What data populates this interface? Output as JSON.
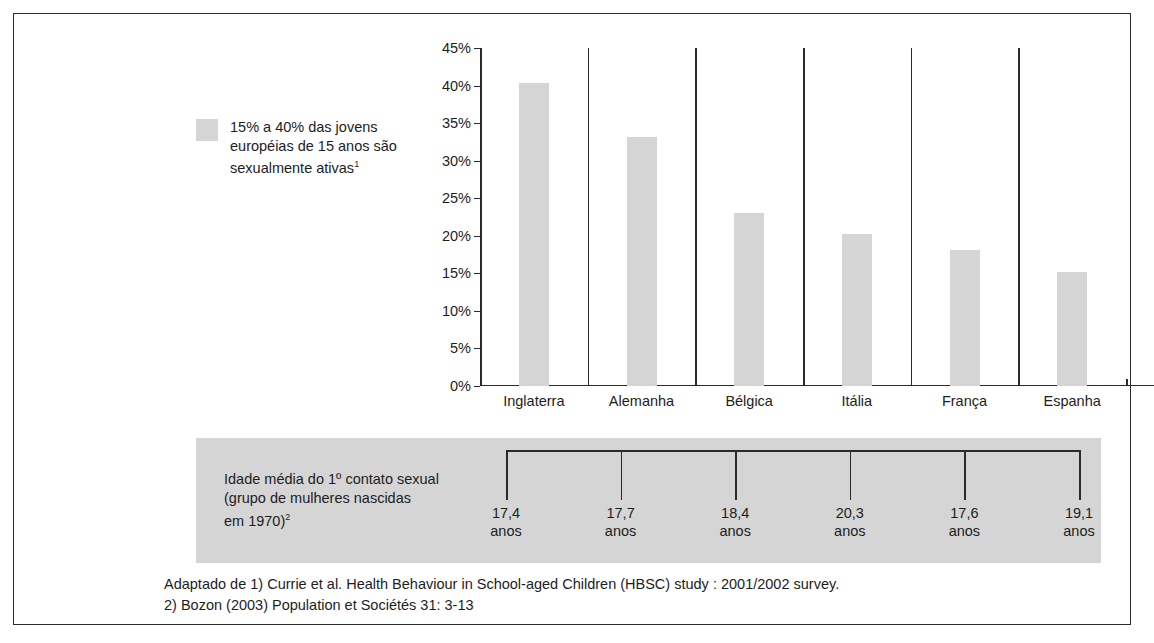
{
  "legend": {
    "swatch_color": "#d5d5d5",
    "text_line1": "15% a 40% das jovens",
    "text_line2": "européias de 15 anos são",
    "text_line3": "sexualmente ativas",
    "footnote_marker": "1"
  },
  "panel": {
    "background_color": "#d5d5d5",
    "label_line1": "Idade média do 1º contato sexual",
    "label_line2": "(grupo de mulheres nascidas",
    "label_line3": "em 1970)",
    "footnote_marker": "2",
    "unit": "anos",
    "ages": [
      "17,4",
      "17,7",
      "18,4",
      "20,3",
      "17,6",
      "19,1"
    ]
  },
  "footnote": {
    "line1": "Adaptado de 1) Currie et al. Health Behaviour in School-aged Children (HBSC) study : 2001/2002 survey.",
    "line2": "2) Bozon (2003) Population et Sociétés 31: 3-13"
  },
  "chart_data": {
    "type": "bar",
    "title": "",
    "xlabel": "",
    "ylabel": "",
    "categories": [
      "Inglaterra",
      "Alemanha",
      "Bélgica",
      "Itália",
      "França",
      "Espanha"
    ],
    "values": [
      40.3,
      33.2,
      23.0,
      20.3,
      18.1,
      15.2
    ],
    "tick_labels": [
      "0%",
      "5%",
      "10%",
      "15%",
      "20%",
      "25%",
      "30%",
      "35%",
      "40%",
      "45%"
    ],
    "tick_values": [
      0,
      5,
      10,
      15,
      20,
      25,
      30,
      35,
      40,
      45
    ],
    "ylim": [
      0,
      45
    ],
    "grid": false,
    "legend_position": "left-outside",
    "bar_color": "#d5d5d5",
    "axis_color": "#2b2b2b"
  }
}
